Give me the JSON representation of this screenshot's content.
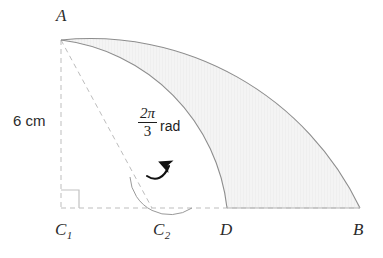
{
  "figure": {
    "colors": {
      "stroke": "#8d8d8d",
      "dashed_stroke": "#b9b9b9",
      "shade_fill": "#f3f3f3",
      "text": "#2b2b2b",
      "arrow": "#111111"
    },
    "points": [
      {
        "id": "A",
        "label": "A",
        "sub": "",
        "x": 61,
        "y": 40
      },
      {
        "id": "C1",
        "label": "C",
        "sub": "1",
        "x": 61,
        "y": 208
      },
      {
        "id": "C2",
        "label": "C",
        "sub": "2",
        "x": 152,
        "y": 208
      },
      {
        "id": "D",
        "label": "D",
        "sub": "",
        "x": 227,
        "y": 208
      },
      {
        "id": "B",
        "label": "B",
        "sub": "",
        "x": 360,
        "y": 208
      }
    ],
    "labels": {
      "vertex_a": "A",
      "vertex_c1": "C",
      "vertex_c1_sub": "1",
      "vertex_c2": "C",
      "vertex_c2_sub": "2",
      "vertex_d": "D",
      "vertex_b": "B"
    },
    "measurements": {
      "side_length": "6 cm",
      "side_length_value": 6,
      "side_length_unit": "cm",
      "side_length_segment": "A to C1"
    },
    "angle": {
      "numerator": "2π",
      "denominator": "3",
      "unit": "rad",
      "value_text": "2π/3 rad",
      "vertex": "C2",
      "measured_from": "C2-B ray",
      "measured_to": "C2-A ray"
    },
    "arcs": [
      {
        "name": "outer-arc",
        "from": "A",
        "to": "B",
        "centre": "C1",
        "radius_px": 299
      },
      {
        "name": "inner-arc",
        "from": "A",
        "to": "D",
        "centre": "C2",
        "radius_px": 191
      }
    ],
    "dashed_segments": [
      {
        "name": "segment-a-c1",
        "from": "A",
        "to": "C1"
      },
      {
        "name": "segment-a-c2",
        "from": "A",
        "to": "C2"
      },
      {
        "name": "segment-c1-b",
        "from": "C1",
        "to": "B"
      }
    ],
    "right_angle": {
      "at": "C1",
      "marker": "square"
    },
    "arrow": {
      "name": "angle-direction-arrow",
      "direction": "counterclockwise-to-A"
    }
  }
}
